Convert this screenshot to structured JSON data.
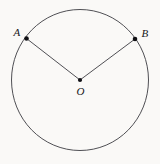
{
  "figure": {
    "background_color": "#faf9f7",
    "stroke_color": "#3c3c42",
    "dot_color": "#101014",
    "label_color": "#17171a",
    "labels": {
      "point_a": "A",
      "point_b": "B",
      "center_o": "O"
    }
  },
  "chart_data": {
    "type": "diagram",
    "shapes": [
      {
        "name": "circle",
        "kind": "ellipse",
        "cx": 80,
        "cy": 80,
        "rx": 68.5,
        "ry": 70.5,
        "stroke": "#3c3c42",
        "stroke_width": 0.9,
        "fill": "none"
      },
      {
        "name": "radius-oa",
        "kind": "segment",
        "x1": 80,
        "y1": 80,
        "x2": 26.5,
        "y2": 38.5,
        "stroke": "#3c3c42",
        "stroke_width": 0.9
      },
      {
        "name": "radius-ob",
        "kind": "segment",
        "x1": 80,
        "y1": 80,
        "x2": 135,
        "y2": 39,
        "stroke": "#3c3c42",
        "stroke_width": 0.9
      }
    ],
    "points": [
      {
        "name": "A",
        "label": "A",
        "x": 26.5,
        "y": 38.5,
        "label_x": 17,
        "label_y": 36,
        "on": "circumference"
      },
      {
        "name": "B",
        "label": "B",
        "x": 135,
        "y": 39,
        "label_x": 141,
        "label_y": 37,
        "on": "circumference"
      },
      {
        "name": "O",
        "label": "O",
        "x": 80,
        "y": 80,
        "label_x": 80,
        "label_y": 94,
        "on": "center"
      }
    ],
    "xlim": [
      0,
      160
    ],
    "ylim": [
      0,
      164
    ],
    "grid": false,
    "legend": false
  }
}
